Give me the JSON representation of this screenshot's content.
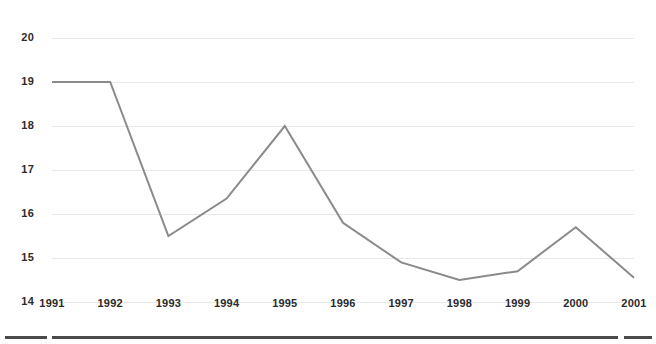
{
  "chart_data": {
    "type": "line",
    "title": "",
    "subtitle": "",
    "xlabel": "",
    "ylabel": "",
    "categories": [
      "1991",
      "1992",
      "1993",
      "1994",
      "1995",
      "1996",
      "1997",
      "1998",
      "1999",
      "2000",
      "2001"
    ],
    "x": [
      1991,
      1992,
      1993,
      1994,
      1995,
      1996,
      1997,
      1998,
      1999,
      2000,
      2001
    ],
    "values": [
      19.0,
      19.0,
      15.5,
      16.35,
      18.0,
      15.8,
      14.9,
      14.5,
      14.7,
      15.7,
      14.55
    ],
    "series": [
      {
        "name": "series-1",
        "values": [
          19.0,
          19.0,
          15.5,
          16.35,
          18.0,
          15.8,
          14.9,
          14.5,
          14.7,
          15.7,
          14.55
        ]
      }
    ],
    "ylim": [
      14,
      20
    ],
    "xlim": [
      1991,
      2001
    ],
    "y_ticks": [
      14,
      15,
      16,
      17,
      18,
      19,
      20
    ],
    "y_tick_labels": [
      "14",
      "15",
      "16",
      "17",
      "18",
      "19",
      "20"
    ],
    "x_tick_labels": [
      "1991",
      "1992",
      "1993",
      "1994",
      "1995",
      "1996",
      "1997",
      "1998",
      "1999",
      "2000",
      "2001"
    ],
    "grid": {
      "horizontal": true,
      "vertical": false
    },
    "legend": {
      "visible": false,
      "position": "none",
      "entries": []
    },
    "annotations": [],
    "colors": {
      "line": "#8a8a8a",
      "grid": "#e8e8e8",
      "tick_label": "#2b2b2b",
      "background": "#ffffff",
      "footer_rule": "#4a4a4a"
    },
    "line_width": 2
  },
  "footer": {
    "rules": [
      {
        "label": "footer-rule-left",
        "x": 5,
        "width": 42
      },
      {
        "label": "footer-rule-main",
        "x": 52,
        "width": 566
      },
      {
        "label": "footer-rule-right",
        "x": 624,
        "width": 28
      }
    ]
  }
}
